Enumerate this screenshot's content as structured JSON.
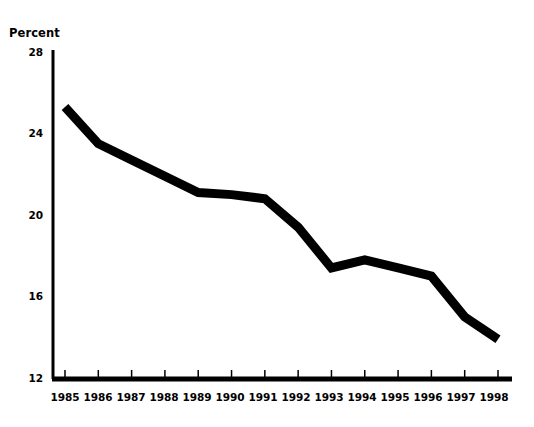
{
  "chart_data": {
    "type": "line",
    "title": "",
    "subtitle": "",
    "xlabel": "",
    "ylabel": "Percent",
    "ylim": [
      12,
      28
    ],
    "yticks": [
      12,
      16,
      20,
      24,
      28
    ],
    "xlim": [
      "1985",
      "1998"
    ],
    "grid": false,
    "legend": null,
    "legend_position": "none",
    "line_color": "#000000",
    "line_width_px": 9,
    "background_color": "#ffffff",
    "axis_color": "#000000",
    "categories": [
      "1985",
      "1986",
      "1987",
      "1988",
      "1989",
      "1990",
      "1991",
      "1992",
      "1993",
      "1994",
      "1995",
      "1996",
      "1997",
      "1998"
    ],
    "values": [
      25.3,
      23.5,
      22.7,
      21.9,
      21.1,
      21.0,
      20.8,
      19.4,
      17.4,
      17.8,
      17.4,
      17.0,
      15.0,
      13.9
    ],
    "series": [
      {
        "name": "Percent",
        "values": [
          25.3,
          23.5,
          22.7,
          21.9,
          21.1,
          21.0,
          20.8,
          19.4,
          17.4,
          17.8,
          17.4,
          17.0,
          15.0,
          13.9
        ]
      }
    ],
    "annotations": []
  },
  "axes": {
    "y_title": "Percent",
    "y_tick_labels": [
      "28",
      "24",
      "20",
      "16",
      "12"
    ],
    "x_tick_labels": [
      "1985",
      "1986",
      "1987",
      "1988",
      "1989",
      "1990",
      "1991",
      "1992",
      "1993",
      "1994",
      "1995",
      "1996",
      "1997",
      "1998"
    ]
  }
}
